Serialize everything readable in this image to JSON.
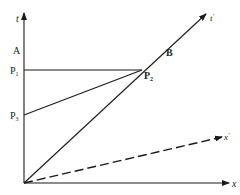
{
  "diagram": {
    "type": "spacetime-diagram",
    "axes": {
      "t": {
        "label": "t"
      },
      "x": {
        "label": "x"
      },
      "t_prime": {
        "label": "t",
        "prime": "′"
      },
      "x_prime": {
        "label": "x",
        "prime": "′",
        "style": "dashed"
      }
    },
    "points": {
      "A": {
        "label": "A"
      },
      "B": {
        "label": "B"
      },
      "P1": {
        "label": "P",
        "sub": "1"
      },
      "P2": {
        "label": "P",
        "sub": "2"
      },
      "P3": {
        "label": "P",
        "sub": "3"
      }
    },
    "colors": {
      "line": "#1a1a1a",
      "background": "#ffffff"
    }
  }
}
